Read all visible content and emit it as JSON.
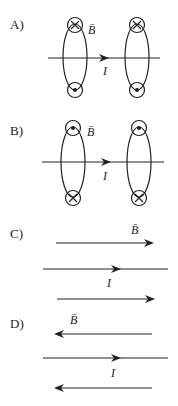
{
  "options": [
    {
      "label": "A)",
      "type": "loops",
      "field_symbol": "B̄",
      "current_symbol": "I",
      "top_marker": "into-page (×)",
      "bottom_marker": "out-of-page (•)"
    },
    {
      "label": "B)",
      "type": "loops",
      "field_symbol": "B̄",
      "current_symbol": "I",
      "top_marker": "out-of-page (•)",
      "bottom_marker": "into-page (×)"
    },
    {
      "label": "C)",
      "type": "parallel-lines",
      "field_symbol": "B̄",
      "current_symbol": "I",
      "field_direction": "right"
    },
    {
      "label": "D)",
      "type": "parallel-lines",
      "field_symbol": "B̄",
      "current_symbol": "I",
      "field_direction": "left"
    }
  ],
  "colors": {
    "ink": "#222222",
    "background": "#ffffff"
  }
}
